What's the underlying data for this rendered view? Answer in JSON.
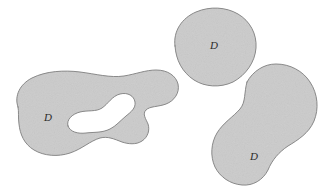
{
  "figure": {
    "name": "three-plane-regions-figure",
    "background_color": "#ffffff",
    "width": 190,
    "height": 190
  },
  "style": {
    "fill_color": "#cbcbcb",
    "stroke_color": "#8a8a8a",
    "stroke_width": 1,
    "label_color": "#2a2a2a",
    "noise_opacity": 0.16
  },
  "regions": [
    {
      "id": "region-left-with-hole",
      "label": "D",
      "label_x": 48,
      "label_y": 118,
      "description": "large irregular blob with an interior hole",
      "has_hole": true,
      "outer_path": "M 18 107 C 14 96 20 84 32 78 C 46 71 64 70 80 72 C 96 74 110 78 124 76 C 136 74 146 70 156 70 C 168 70 176 76 178 84 C 180 93 174 101 166 104 C 158 107 150 106 146 110 C 142 114 146 119 148 124 C 150 130 148 137 142 141 C 136 145 128 144 122 142 C 114 139 108 136 100 138 C 90 141 82 149 70 153 C 58 157 44 156 34 150 C 24 144 20 134 19 124 C 18 117 19 112 18 107 Z",
      "hole_path": "M 68 126 C 66 120 72 114 80 112 C 88 110 96 112 102 108 C 108 104 112 96 120 94 C 128 92 134 96 135 102 C 136 108 131 112 126 116 C 120 121 116 126 110 129 C 102 133 94 132 86 133 C 78 134 70 132 68 126 Z"
    },
    {
      "id": "region-top-right-disk",
      "label": "D",
      "label_x": 214,
      "label_y": 46,
      "description": "rounded disk shaped region",
      "has_hole": false,
      "outer_path": "M 175 46 C 173 31 182 18 196 12 C 210 6 226 7 238 14 C 250 21 257 34 256 48 C 255 62 246 75 233 82 C 220 88 205 87 194 80 C 182 72 176 60 175 46 Z",
      "hole_path": ""
    },
    {
      "id": "region-bottom-right-peanut",
      "label": "D",
      "label_x": 254,
      "label_y": 157,
      "description": "peanut or dumbbell shaped region",
      "has_hole": false,
      "outer_path": "M 247 82 C 253 71 264 64 276 64 C 290 64 303 71 310 82 C 318 94 319 109 314 121 C 309 133 298 140 288 146 C 279 152 272 160 268 170 C 263 180 253 186 242 185 C 230 184 220 177 215 167 C 210 156 211 143 217 133 C 223 123 233 117 240 109 C 246 102 244 92 247 82 Z",
      "hole_path": ""
    }
  ]
}
